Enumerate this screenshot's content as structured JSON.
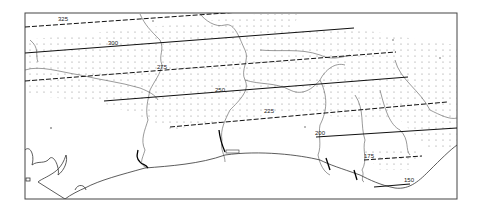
{
  "map": {
    "type": "isoline map",
    "frame": {
      "x": 25,
      "y": 13,
      "width": 432,
      "height": 186
    },
    "colors": {
      "background": "#ffffff",
      "ink": "#222222",
      "river": "#555555",
      "dots": "#666666",
      "frame": "#444444"
    },
    "isolines": [
      {
        "value": "325",
        "style": "dashed",
        "label_x": 58,
        "label_y": 21
      },
      {
        "value": "300",
        "style": "solid",
        "label_x": 108,
        "label_y": 45
      },
      {
        "value": "275",
        "style": "dashed",
        "label_x": 157,
        "label_y": 69
      },
      {
        "value": "250",
        "style": "solid",
        "label_x": 215,
        "label_y": 92
      },
      {
        "value": "225",
        "style": "dashed",
        "label_x": 264,
        "label_y": 113
      },
      {
        "value": "200",
        "style": "solid",
        "label_x": 316,
        "label_y": 135
      },
      {
        "value": "175",
        "style": "dashed",
        "label_x": 365,
        "label_y": 159
      },
      {
        "value": "150",
        "style": "solid",
        "label_x": 405,
        "label_y": 182
      }
    ]
  }
}
